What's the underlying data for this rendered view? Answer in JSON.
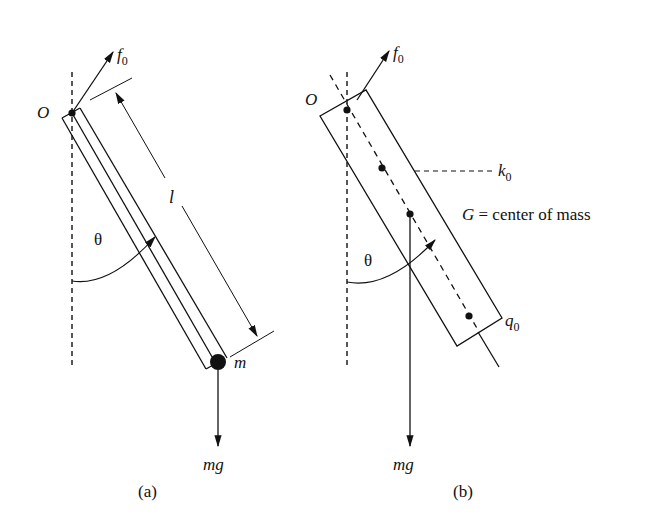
{
  "figure_a": {
    "caption": "(a)",
    "pivot_label": "O",
    "force_label": "f",
    "force_sub": "0",
    "length_label": "l",
    "angle_label": "θ",
    "mass_label": "m",
    "weight_label": "mg"
  },
  "figure_b": {
    "caption": "(b)",
    "pivot_label": "O",
    "force_label": "f",
    "force_sub": "0",
    "k_label": "k",
    "k_sub": "0",
    "q_label": "q",
    "q_sub": "0",
    "angle_label": "θ",
    "weight_label": "mg",
    "g_note_symbol": "G",
    "g_note_text": " = center of mass"
  },
  "colors": {
    "ink": "#111111",
    "background": "#ffffff"
  }
}
